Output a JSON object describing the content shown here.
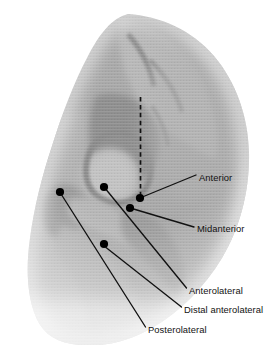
{
  "figure": {
    "modality": "radiograph",
    "region": "hip",
    "background_color": "#ffffff",
    "annotation_color": "#111111",
    "marker_color": "#000000",
    "reference_line_style": "dashed"
  },
  "reference_line": {
    "name": "vertical-dashed-reference-line",
    "x1": 140.5,
    "y1": 97,
    "x2": 140.5,
    "y2": 197
  },
  "annotations": [
    {
      "id": "anterior",
      "label": "Anterior",
      "marker": {
        "x": 140,
        "y": 198,
        "r": 4.1
      },
      "leader": {
        "x1": 143.5,
        "y1": 196.5,
        "x2": 196,
        "y2": 175
      },
      "text": {
        "x": 199,
        "y": 171.5
      }
    },
    {
      "id": "midanterior",
      "label": "Midanterior",
      "marker": {
        "x": 130,
        "y": 208,
        "r": 4.1
      },
      "leader": {
        "x1": 133.5,
        "y1": 209,
        "x2": 194,
        "y2": 227
      },
      "text": {
        "x": 197,
        "y": 222.5
      }
    },
    {
      "id": "anterolateral",
      "label": "Anterolateral",
      "marker": {
        "x": 104,
        "y": 187,
        "r": 4.1
      },
      "leader": {
        "x1": 106.5,
        "y1": 190,
        "x2": 186.5,
        "y2": 288
      },
      "text": {
        "x": 189,
        "y": 284.5
      }
    },
    {
      "id": "distal-anterolateral",
      "label": "Distal anterolateral",
      "marker": {
        "x": 104,
        "y": 244,
        "r": 4.1
      },
      "leader": {
        "x1": 106,
        "y1": 247.5,
        "x2": 181.5,
        "y2": 307
      },
      "text": {
        "x": 184,
        "y": 303.5
      }
    },
    {
      "id": "posterolateral",
      "label": "Posterolateral",
      "marker": {
        "x": 60,
        "y": 192,
        "r": 4.1
      },
      "leader": {
        "x1": 62,
        "y1": 195.5,
        "x2": 145.5,
        "y2": 327
      },
      "text": {
        "x": 148,
        "y": 323.5
      }
    }
  ]
}
